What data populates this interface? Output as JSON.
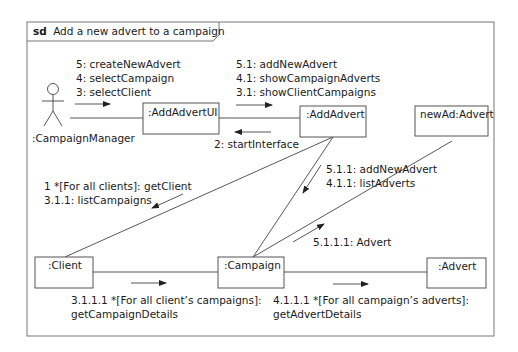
{
  "frame": {
    "keyword": "sd",
    "title": "Add a new advert to a campaign"
  },
  "actor": {
    "label": ":CampaignManager"
  },
  "objects": {
    "addAdvertUI": ":AddAdvertUI",
    "addAdvert": ":AddAdvert",
    "newAd": "newAd:Advert",
    "client": ":Client",
    "campaign": ":Campaign",
    "advert": ":Advert"
  },
  "messages": {
    "actor_to_ui": [
      "5: createNewAdvert",
      "4: selectCampaign",
      "3: selectClient"
    ],
    "ui_to_addadvert": [
      "5.1: addNewAdvert",
      "4.1: showCampaignAdverts",
      "3.1: showClientCampaigns"
    ],
    "addadvert_to_ui": [
      "2: startInterface"
    ],
    "addadvert_to_client": [
      "1 *[For all clients]: getClient",
      "3.1.1: listCampaigns"
    ],
    "addadvert_to_campaign": [
      "5.1.1: addNewAdvert",
      "4.1.1: listAdverts"
    ],
    "campaign_to_newad": [
      "5.1.1.1: Advert"
    ],
    "client_to_campaign": [
      "3.1.1.1 *[For all client’s campaigns]:",
      "getCampaignDetails"
    ],
    "campaign_to_advert": [
      "4.1.1.1 *[For all campaign’s adverts]:",
      "getAdvertDetails"
    ]
  }
}
